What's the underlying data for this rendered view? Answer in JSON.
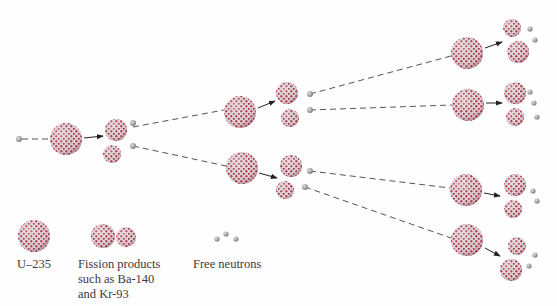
{
  "diagram": {
    "colors": {
      "nucleus_red": "#b0324a",
      "nucleus_white": "#e8e4e4",
      "neutron": "#9a9a9a",
      "arrow": "#333333"
    },
    "nodes": [
      {
        "id": "n0",
        "type": "neutron",
        "x": 19,
        "y": 139
      },
      {
        "id": "u0",
        "type": "U-235",
        "x": 66,
        "y": 139,
        "r": 16
      },
      {
        "id": "f0a",
        "type": "fission-product",
        "x": 116,
        "y": 130,
        "r": 11
      },
      {
        "id": "f0b",
        "type": "fission-product",
        "x": 112,
        "y": 154,
        "r": 9
      },
      {
        "id": "u1",
        "type": "U-235",
        "x": 240,
        "y": 112,
        "r": 16
      },
      {
        "id": "u2",
        "type": "U-235",
        "x": 242,
        "y": 168,
        "r": 16
      },
      {
        "id": "f1a",
        "type": "fission-product",
        "x": 287,
        "y": 93,
        "r": 11
      },
      {
        "id": "f1b",
        "type": "fission-product",
        "x": 290,
        "y": 118,
        "r": 9
      },
      {
        "id": "f2a",
        "type": "fission-product",
        "x": 291,
        "y": 166,
        "r": 11
      },
      {
        "id": "f2b",
        "type": "fission-product",
        "x": 285,
        "y": 190,
        "r": 9
      },
      {
        "id": "u3",
        "type": "U-235",
        "x": 467,
        "y": 53,
        "r": 16
      },
      {
        "id": "u4",
        "type": "U-235",
        "x": 468,
        "y": 105,
        "r": 16
      },
      {
        "id": "u5",
        "type": "U-235",
        "x": 466,
        "y": 190,
        "r": 16
      },
      {
        "id": "u6",
        "type": "U-235",
        "x": 467,
        "y": 240,
        "r": 16
      }
    ],
    "legend": [
      {
        "key": "u235",
        "label": "U–235"
      },
      {
        "key": "fission",
        "label_lines": [
          "Fission products",
          "such as Ba-140",
          "and Kr-93"
        ]
      },
      {
        "key": "neutrons",
        "label": "Free neutrons"
      }
    ]
  }
}
